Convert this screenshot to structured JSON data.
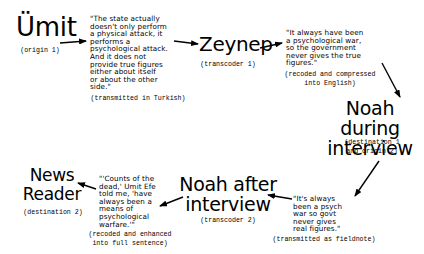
{
  "nodes": {
    "umit": {
      "name": "Ümit",
      "role": "(origin 1)"
    },
    "zeynep": {
      "name": "Zeynep",
      "role": "(transcoder 1)"
    },
    "noah_during": {
      "line1": "Noah during",
      "line2": "interview",
      "role_line1": "(destination 1",
      "role_line2": "and origin 2)"
    },
    "noah_after": {
      "line1": "Noah after",
      "line2": "interview",
      "role": "(transcoder 2)"
    },
    "news_reader": {
      "line1": "News",
      "line2": "Reader",
      "role": "(destination 2)"
    }
  },
  "messages": {
    "m1": {
      "lines": [
        "\"The state actually",
        "doesn't only perform",
        "a physical attack, it",
        "performs a",
        "psychological attack.",
        "And it does not",
        "provide true figures",
        "either about itself",
        "or about the other",
        "side.\""
      ],
      "note": "(transmitted in Turkish)"
    },
    "m2": {
      "lines": [
        "\"It always have been",
        "a psychological war,",
        "so the government",
        "never gives the true",
        "figures.\""
      ],
      "note_line1": "(recoded and compressed",
      "note_line2": "into English)"
    },
    "m3": {
      "lines": [
        "\"It's always",
        "been a psych",
        "war so govt",
        "never gives",
        "real figures.\""
      ],
      "note": "(transmitted as fieldnote)"
    },
    "m4": {
      "lines": [
        "\"'Counts of the",
        "dead,' Umit Efe",
        "told me, 'have",
        "always been a",
        "means of",
        "psychological",
        "warfare.'\""
      ],
      "note_line1": "(recoded and enhanced",
      "note_line2": "into full sentence)"
    }
  },
  "arrows": [
    {
      "from": "umit",
      "to": "m1"
    },
    {
      "from": "m1",
      "to": "zeynep"
    },
    {
      "from": "zeynep",
      "to": "m2"
    },
    {
      "from": "m2",
      "to": "noah_during"
    },
    {
      "from": "noah_during",
      "to": "m3"
    },
    {
      "from": "m3",
      "to": "noah_after"
    },
    {
      "from": "noah_after",
      "to": "m4"
    },
    {
      "from": "m4",
      "to": "news_reader"
    }
  ]
}
